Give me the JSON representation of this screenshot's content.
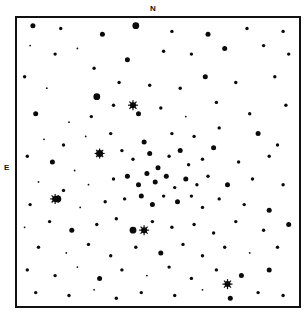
{
  "chart": {
    "type": "finder-chart",
    "north_label": "N",
    "east_label": "E",
    "ink_color": "#0a0a0a",
    "background_color": "#ffffff",
    "stars": [
      [
        0.05,
        0.02,
        3
      ],
      [
        0.15,
        0.03,
        2
      ],
      [
        0.3,
        0.05,
        3
      ],
      [
        0.42,
        0.02,
        4
      ],
      [
        0.55,
        0.04,
        2
      ],
      [
        0.68,
        0.05,
        3
      ],
      [
        0.82,
        0.03,
        2
      ],
      [
        0.95,
        0.04,
        2
      ],
      [
        0.04,
        0.09,
        1
      ],
      [
        0.13,
        0.12,
        2
      ],
      [
        0.21,
        0.1,
        1
      ],
      [
        0.27,
        0.17,
        2
      ],
      [
        0.39,
        0.14,
        3
      ],
      [
        0.52,
        0.11,
        2
      ],
      [
        0.62,
        0.12,
        2
      ],
      [
        0.74,
        0.1,
        3
      ],
      [
        0.88,
        0.09,
        2
      ],
      [
        0.97,
        0.12,
        2
      ],
      [
        0.02,
        0.2,
        2
      ],
      [
        0.1,
        0.24,
        1
      ],
      [
        0.28,
        0.27,
        4
      ],
      [
        0.36,
        0.22,
        2
      ],
      [
        0.47,
        0.23,
        2
      ],
      [
        0.58,
        0.24,
        2
      ],
      [
        0.67,
        0.2,
        3
      ],
      [
        0.78,
        0.22,
        2
      ],
      [
        0.92,
        0.2,
        2
      ],
      [
        0.06,
        0.33,
        3
      ],
      [
        0.18,
        0.36,
        1
      ],
      [
        0.26,
        0.34,
        2
      ],
      [
        0.34,
        0.3,
        2
      ],
      [
        0.43,
        0.33,
        3
      ],
      [
        0.51,
        0.31,
        2
      ],
      [
        0.6,
        0.34,
        1
      ],
      [
        0.71,
        0.29,
        2
      ],
      [
        0.83,
        0.33,
        2
      ],
      [
        0.96,
        0.3,
        2
      ],
      [
        0.09,
        0.42,
        1
      ],
      [
        0.16,
        0.44,
        2
      ],
      [
        0.24,
        0.41,
        1
      ],
      [
        0.33,
        0.4,
        2
      ],
      [
        0.45,
        0.43,
        3
      ],
      [
        0.55,
        0.4,
        2
      ],
      [
        0.63,
        0.41,
        2
      ],
      [
        0.72,
        0.38,
        2
      ],
      [
        0.86,
        0.4,
        3
      ],
      [
        0.93,
        0.44,
        2
      ],
      [
        0.03,
        0.48,
        2
      ],
      [
        0.12,
        0.5,
        3
      ],
      [
        0.2,
        0.53,
        1
      ],
      [
        0.29,
        0.47,
        4
      ],
      [
        0.37,
        0.46,
        2
      ],
      [
        0.41,
        0.49,
        2
      ],
      [
        0.47,
        0.47,
        3
      ],
      [
        0.5,
        0.52,
        3
      ],
      [
        0.54,
        0.48,
        2
      ],
      [
        0.58,
        0.46,
        3
      ],
      [
        0.61,
        0.51,
        2
      ],
      [
        0.66,
        0.49,
        2
      ],
      [
        0.7,
        0.45,
        3
      ],
      [
        0.79,
        0.5,
        2
      ],
      [
        0.9,
        0.48,
        2
      ],
      [
        0.07,
        0.57,
        1
      ],
      [
        0.16,
        0.6,
        2
      ],
      [
        0.25,
        0.58,
        1
      ],
      [
        0.34,
        0.56,
        2
      ],
      [
        0.39,
        0.55,
        3
      ],
      [
        0.43,
        0.58,
        3
      ],
      [
        0.46,
        0.54,
        3
      ],
      [
        0.49,
        0.57,
        3
      ],
      [
        0.53,
        0.55,
        3
      ],
      [
        0.56,
        0.59,
        2
      ],
      [
        0.6,
        0.56,
        3
      ],
      [
        0.64,
        0.58,
        2
      ],
      [
        0.68,
        0.55,
        2
      ],
      [
        0.75,
        0.58,
        3
      ],
      [
        0.84,
        0.56,
        2
      ],
      [
        0.95,
        0.58,
        2
      ],
      [
        0.04,
        0.65,
        2
      ],
      [
        0.14,
        0.63,
        4
      ],
      [
        0.22,
        0.66,
        1
      ],
      [
        0.31,
        0.64,
        2
      ],
      [
        0.38,
        0.63,
        2
      ],
      [
        0.44,
        0.62,
        3
      ],
      [
        0.48,
        0.65,
        3
      ],
      [
        0.52,
        0.62,
        2
      ],
      [
        0.57,
        0.64,
        3
      ],
      [
        0.62,
        0.62,
        2
      ],
      [
        0.66,
        0.66,
        2
      ],
      [
        0.72,
        0.63,
        2
      ],
      [
        0.81,
        0.65,
        2
      ],
      [
        0.9,
        0.67,
        3
      ],
      [
        0.02,
        0.73,
        1
      ],
      [
        0.11,
        0.71,
        2
      ],
      [
        0.19,
        0.74,
        3
      ],
      [
        0.28,
        0.72,
        2
      ],
      [
        0.35,
        0.7,
        2
      ],
      [
        0.41,
        0.74,
        4
      ],
      [
        0.48,
        0.71,
        2
      ],
      [
        0.55,
        0.73,
        2
      ],
      [
        0.63,
        0.72,
        2
      ],
      [
        0.7,
        0.75,
        2
      ],
      [
        0.78,
        0.71,
        2
      ],
      [
        0.88,
        0.74,
        2
      ],
      [
        0.97,
        0.72,
        3
      ],
      [
        0.07,
        0.8,
        2
      ],
      [
        0.17,
        0.82,
        1
      ],
      [
        0.25,
        0.79,
        2
      ],
      [
        0.33,
        0.83,
        2
      ],
      [
        0.42,
        0.8,
        2
      ],
      [
        0.51,
        0.82,
        3
      ],
      [
        0.59,
        0.79,
        2
      ],
      [
        0.66,
        0.83,
        2
      ],
      [
        0.74,
        0.8,
        2
      ],
      [
        0.83,
        0.82,
        1
      ],
      [
        0.93,
        0.8,
        2
      ],
      [
        0.03,
        0.88,
        2
      ],
      [
        0.13,
        0.9,
        2
      ],
      [
        0.21,
        0.87,
        1
      ],
      [
        0.29,
        0.91,
        3
      ],
      [
        0.37,
        0.88,
        2
      ],
      [
        0.46,
        0.9,
        1
      ],
      [
        0.54,
        0.87,
        2
      ],
      [
        0.62,
        0.91,
        2
      ],
      [
        0.71,
        0.88,
        2
      ],
      [
        0.8,
        0.9,
        3
      ],
      [
        0.9,
        0.88,
        3
      ],
      [
        0.06,
        0.96,
        2
      ],
      [
        0.18,
        0.97,
        2
      ],
      [
        0.27,
        0.95,
        1
      ],
      [
        0.35,
        0.98,
        2
      ],
      [
        0.44,
        0.96,
        2
      ],
      [
        0.56,
        0.97,
        2
      ],
      [
        0.66,
        0.95,
        1
      ],
      [
        0.76,
        0.98,
        3
      ],
      [
        0.86,
        0.96,
        2
      ],
      [
        0.95,
        0.97,
        2
      ]
    ],
    "bright_stars": [
      [
        0.13,
        0.63
      ],
      [
        0.29,
        0.47
      ],
      [
        0.41,
        0.3
      ],
      [
        0.45,
        0.74
      ],
      [
        0.75,
        0.93
      ]
    ]
  }
}
